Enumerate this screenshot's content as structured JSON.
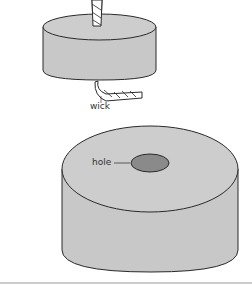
{
  "diagram": {
    "labels": {
      "wick": "wick",
      "hole": "hole"
    },
    "colors": {
      "fill": "#c8c8c8",
      "stroke": "#2a2a2a",
      "hole_fill": "#8a8a8a",
      "rule": "#9a9a9a"
    }
  }
}
